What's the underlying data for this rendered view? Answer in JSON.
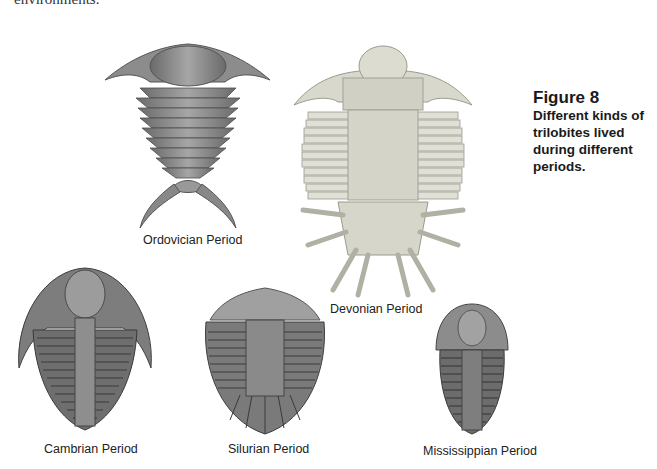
{
  "page": {
    "cut_off_text": "environments."
  },
  "figure": {
    "number": "Figure 8",
    "caption": "Different kinds of trilobites lived during different periods."
  },
  "trilobites": [
    {
      "id": "ordovician",
      "label": "Ordovician Period",
      "icon": "trilobite-spined-icon"
    },
    {
      "id": "devonian",
      "label": "Devonian Period",
      "icon": "trilobite-spiky-icon"
    },
    {
      "id": "cambrian",
      "label": "Cambrian Period",
      "icon": "trilobite-cambrian-icon"
    },
    {
      "id": "silurian",
      "label": "Silurian Period",
      "icon": "trilobite-silurian-icon"
    },
    {
      "id": "mississippian",
      "label": "Mississippian Period",
      "icon": "trilobite-mississippian-icon"
    }
  ],
  "colors": {
    "shell_dark": "#5e5e5e",
    "shell_mid": "#8a8a8a",
    "shell_light": "#d4d4c8"
  }
}
